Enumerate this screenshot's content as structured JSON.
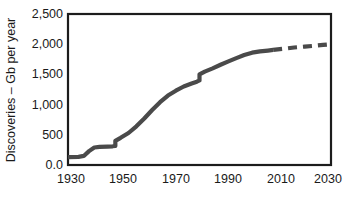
{
  "chart_data": {
    "type": "line",
    "title": "",
    "subtitle": "",
    "xlabel": "",
    "ylabel": "Discoveries – Gb per year",
    "xlim": [
      1930,
      2030
    ],
    "ylim": [
      0,
      2500
    ],
    "grid": false,
    "legend": "none",
    "x_ticks": [
      "1930",
      "1950",
      "1970",
      "1990",
      "2010",
      "2030"
    ],
    "x_tick_values": [
      1930,
      1950,
      1970,
      1990,
      2010,
      2030
    ],
    "y_ticks": [
      "0.0",
      "500",
      "1,000",
      "1,500",
      "2,000",
      "2,500"
    ],
    "y_tick_values": [
      0,
      500,
      1000,
      1500,
      2000,
      2500
    ],
    "series": [
      {
        "name": "Cumulative discoveries (historical)",
        "style": "solid",
        "color": "#4a4a4a",
        "x": [
          1930,
          1934,
          1936,
          1938,
          1940,
          1942,
          1945,
          1947,
          1948,
          1948,
          1950,
          1953,
          1956,
          1959,
          1962,
          1965,
          1968,
          1971,
          1974,
          1977,
          1979,
          1980,
          1980,
          1982,
          1985,
          1988,
          1991,
          1994,
          1997,
          2000,
          2003,
          2006,
          2008
        ],
        "values": [
          130,
          135,
          150,
          230,
          290,
          300,
          305,
          310,
          315,
          400,
          450,
          530,
          640,
          770,
          910,
          1040,
          1150,
          1230,
          1300,
          1350,
          1380,
          1400,
          1500,
          1545,
          1600,
          1660,
          1715,
          1770,
          1820,
          1860,
          1880,
          1895,
          1905
        ]
      },
      {
        "name": "Cumulative discoveries (projected)",
        "style": "dashed",
        "color": "#4a4a4a",
        "x": [
          2008,
          2012,
          2016,
          2020,
          2024,
          2027,
          2030
        ],
        "values": [
          1905,
          1925,
          1945,
          1960,
          1975,
          1988,
          2000
        ]
      }
    ],
    "annotations": []
  },
  "axes": {
    "y_title": "Discoveries – Gb per year"
  }
}
